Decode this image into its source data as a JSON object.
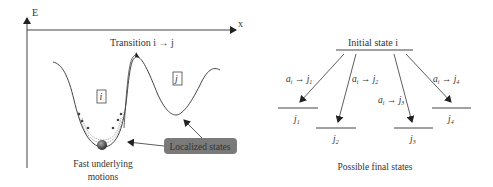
{
  "left_panel": {
    "axis_y_label": "E",
    "axis_x_label": "x",
    "transition_label": "Transition i → j",
    "state_i_label": "i",
    "state_j_label": "j",
    "localized_states_label": "Localized states",
    "fast_motions_line1": "Fast underlying",
    "fast_motions_line2": "motions"
  },
  "right_panel": {
    "initial_state_label": "Initial state i",
    "final_states_caption": "Possible final states",
    "final_states": [
      {
        "label": "j1",
        "sub": "1",
        "rate_label": "a_i → j_1"
      },
      {
        "label": "j2",
        "sub": "2",
        "rate_label": "a_i → j_2"
      },
      {
        "label": "j3",
        "sub": "3",
        "rate_label": "a_i → j_3"
      },
      {
        "label": "j4",
        "sub": "4",
        "rate_label": "a_i → j_4"
      }
    ]
  },
  "colors": {
    "line": "#444444",
    "badge_bg": "#7a7a7a",
    "badge_text": "#111111",
    "ball": "#555555"
  }
}
